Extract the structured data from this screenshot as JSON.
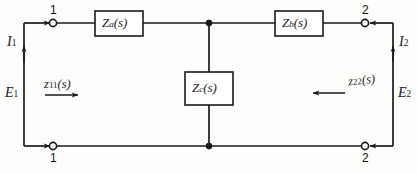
{
  "diagram": {
    "type": "electrical-circuit-schematic",
    "stroke_color": "#1a1a1a",
    "background_color": "#fdfdfc",
    "elements": {
      "series_branch_left": {
        "label_base": "Z",
        "label_sub": "a",
        "label_arg": "(s)",
        "label_full": "Za(s)"
      },
      "series_branch_right": {
        "label_base": "Z",
        "label_sub": "b",
        "label_arg": "(s)",
        "label_full": "Zb(s)"
      },
      "shunt_branch_center": {
        "label_base": "Z",
        "label_sub": "c",
        "label_arg": "(s)",
        "label_full": "Zc(s)"
      }
    },
    "terminals": {
      "top_left": "1",
      "bottom_left": "1",
      "top_right": "2",
      "bottom_right": "2"
    },
    "port_quantities": {
      "input_current": {
        "base": "I",
        "sub": "1"
      },
      "input_voltage": {
        "base": "E",
        "sub": "1"
      },
      "output_current": {
        "base": "I",
        "sub": "2"
      },
      "output_voltage": {
        "base": "E",
        "sub": "2"
      }
    },
    "driving_point_impedances": {
      "input": {
        "base": "z",
        "sub": "11",
        "arg": "(s)",
        "full": "z11(s)",
        "arrow_direction": "right"
      },
      "output": {
        "base": "z",
        "sub": "22",
        "arg": "(s)",
        "full": "z22(s)",
        "arrow_direction": "left"
      }
    }
  }
}
